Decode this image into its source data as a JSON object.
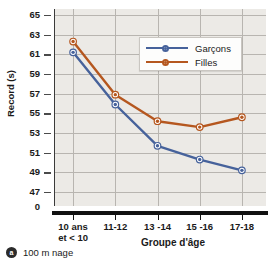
{
  "chart_data": {
    "type": "line",
    "title": "",
    "xlabel": "Groupe d'âge",
    "ylabel": "Record (s)",
    "categories": [
      "10 ans et < 10",
      "11-12",
      "13 -14",
      "15 -16",
      "17-18"
    ],
    "x_tick_labels": [
      {
        "line1": "10 ans",
        "line2": "et < 10"
      },
      {
        "line1": "11-12",
        "line2": ""
      },
      {
        "line1": "13 -14",
        "line2": ""
      },
      {
        "line1": "15 -16",
        "line2": ""
      },
      {
        "line1": "17-18",
        "line2": ""
      }
    ],
    "y_tick_labels": [
      "65",
      "63",
      "61",
      "59",
      "57",
      "55",
      "53",
      "51",
      "49",
      "47",
      "0"
    ],
    "y_tick_values": [
      65,
      63,
      61,
      59,
      57,
      55,
      53,
      51,
      49,
      47,
      0
    ],
    "ylim": [
      46,
      65
    ],
    "grid": true,
    "legend_position": "top-right",
    "series": [
      {
        "name": "Garçons",
        "color": "#46629b",
        "marker": "circle",
        "values": [
          61.2,
          55.9,
          51.7,
          50.3,
          49.2
        ]
      },
      {
        "name": "Filles",
        "color": "#b5571f",
        "marker": "circle",
        "values": [
          62.3,
          56.9,
          54.2,
          53.6,
          54.6
        ]
      }
    ]
  },
  "legend": {
    "items": [
      {
        "label": "Garçons",
        "color": "#46629b"
      },
      {
        "label": "Filles",
        "color": "#b5571f"
      }
    ]
  },
  "caption": {
    "badge": "a",
    "text": "100 m nage"
  },
  "colors": {
    "boys": "#46629b",
    "girls": "#b5571f",
    "plot_background": "#eceae6",
    "gridline": "#b8b5b0",
    "axis": "#111111"
  }
}
